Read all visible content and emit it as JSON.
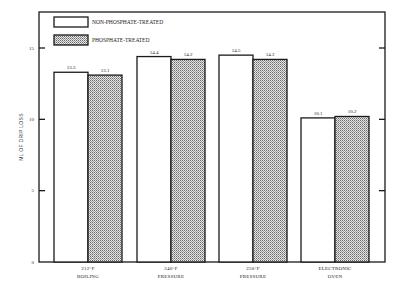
{
  "chart_data": {
    "type": "bar",
    "title": "",
    "xlabel": "",
    "ylabel": "ML OF DRIP LOSS",
    "ylim": [
      0,
      15
    ],
    "yticks": [
      0,
      5,
      10,
      15
    ],
    "grid": false,
    "legend_position": "top-left inside",
    "categories": [
      [
        "212°F",
        "BOILING"
      ],
      [
        "240°F",
        "PRESSURE"
      ],
      [
        "250°F",
        "PRESSURE"
      ],
      [
        "ELECTRONIC",
        "OVEN"
      ]
    ],
    "series": [
      {
        "name": "NON-PHOSPHATE-TREATED",
        "fill": "white",
        "values": [
          13.3,
          14.4,
          14.5,
          10.1
        ]
      },
      {
        "name": "PHOSPHATE-TREATED",
        "fill": "stippled",
        "values": [
          13.1,
          14.2,
          14.2,
          10.2
        ]
      }
    ]
  },
  "colors": {
    "stroke": "#1a1a1a",
    "white_bar": "#ffffff",
    "stipple_light": "#e8e8e8",
    "stipple_dark": "#555555"
  }
}
